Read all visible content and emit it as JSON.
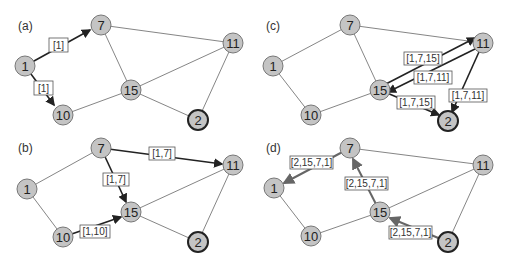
{
  "panels": [
    {
      "id": "a",
      "label": "(a)",
      "labels": [
        "[1]",
        "[1]"
      ]
    },
    {
      "id": "c",
      "label": "(c)",
      "labels": [
        "[1,7,15]",
        "[1,7,11]",
        "[1,7,15]",
        "[1,7,11]"
      ]
    },
    {
      "id": "b",
      "label": "(b)",
      "labels": [
        "[1,7]",
        "[1,7]",
        "[1,10]"
      ]
    },
    {
      "id": "d",
      "label": "(d)",
      "labels": [
        "[2,15,7,1]",
        "[2,15,7,1]",
        "[2,15,7,1]"
      ]
    }
  ],
  "nodes": {
    "n1": "1",
    "n7": "7",
    "n11": "11",
    "n15": "15",
    "n10": "10",
    "n2": "2"
  },
  "colors": {
    "node_fill": "#c4c4c4",
    "edge": "#777777",
    "path": "#222222"
  }
}
